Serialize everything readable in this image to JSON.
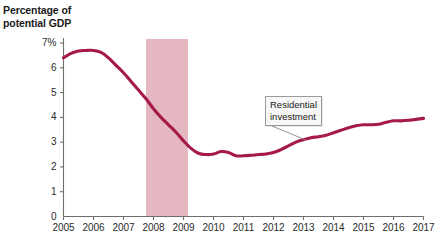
{
  "chart_data": {
    "type": "line",
    "title": "",
    "ylabel_line1": "Percentage of",
    "ylabel_line2": "potential GDP",
    "xlabel": "",
    "xlim": [
      2005,
      2017
    ],
    "ylim": [
      0,
      7
    ],
    "grid": false,
    "legend": "none",
    "y_ticks": [
      "7%",
      "6",
      "5",
      "4",
      "3",
      "2",
      "1",
      "0"
    ],
    "y_tick_values": [
      7,
      6,
      5,
      4,
      3,
      2,
      1,
      0
    ],
    "x_ticks": [
      "2005",
      "2006",
      "2007",
      "2008",
      "2009",
      "2010",
      "2011",
      "2012",
      "2013",
      "2014",
      "2015",
      "2016",
      "2017"
    ],
    "x_tick_values": [
      2005,
      2006,
      2007,
      2008,
      2009,
      2010,
      2011,
      2012,
      2013,
      2014,
      2015,
      2016,
      2017
    ],
    "series": [
      {
        "name": "Residential investment",
        "color": "#a5194c",
        "x": [
          2005.0,
          2005.25,
          2005.5,
          2005.75,
          2006.0,
          2006.25,
          2006.5,
          2006.75,
          2007.0,
          2007.25,
          2007.5,
          2007.75,
          2008.0,
          2008.25,
          2008.5,
          2008.75,
          2009.0,
          2009.25,
          2009.5,
          2009.75,
          2010.0,
          2010.25,
          2010.5,
          2010.75,
          2011.0,
          2011.25,
          2011.5,
          2011.75,
          2012.0,
          2012.25,
          2012.5,
          2012.75,
          2013.0,
          2013.25,
          2013.5,
          2013.75,
          2014.0,
          2014.25,
          2014.5,
          2014.75,
          2015.0,
          2015.25,
          2015.5,
          2015.75,
          2016.0,
          2016.25,
          2016.5,
          2016.75,
          2017.0
        ],
        "y": [
          6.4,
          6.58,
          6.68,
          6.7,
          6.7,
          6.62,
          6.4,
          6.1,
          5.8,
          5.45,
          5.1,
          4.75,
          4.35,
          4.0,
          3.7,
          3.4,
          3.05,
          2.75,
          2.55,
          2.5,
          2.52,
          2.62,
          2.58,
          2.45,
          2.45,
          2.47,
          2.5,
          2.52,
          2.58,
          2.7,
          2.85,
          3.0,
          3.1,
          3.18,
          3.22,
          3.28,
          3.38,
          3.48,
          3.58,
          3.66,
          3.7,
          3.7,
          3.72,
          3.8,
          3.86,
          3.86,
          3.88,
          3.92,
          3.96
        ]
      }
    ],
    "annotations": [
      {
        "label_line1": "Residential",
        "label_line2": "investment",
        "point_x": 2013.05,
        "point_y": 3.1
      }
    ],
    "shaded_regions": [
      {
        "name": "recession-band",
        "x_start": 2007.75,
        "x_end": 2009.15,
        "color": "#e5b7c0"
      }
    ]
  }
}
